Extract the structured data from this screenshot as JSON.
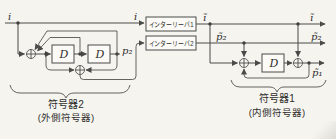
{
  "diagram": {
    "type": "block-diagram",
    "signals": {
      "input_left": "i",
      "input_before_interleaver1": "i",
      "i_interleaved_mid": "ĩ",
      "i_interleaved_out": "ĩ",
      "p2": "p₂",
      "p2_interleaved_mid": "p̃₂",
      "p2_interleaved_out": "p̃₂",
      "p1_out": "p̃₁"
    },
    "blocks": {
      "interleaver1": "インターリーバ1",
      "interleaver2": "インターリーバ2",
      "delay1": "D",
      "delay2": "D",
      "delay3": "D"
    },
    "groups": {
      "encoder2_title": "符号器2",
      "encoder2_subtitle": "(外側符号器)",
      "encoder1_title": "符号器1",
      "encoder1_subtitle": "(内側符号器)"
    },
    "colors": {
      "stroke": "#4a4a48",
      "background": "#f5f4ef",
      "box_fill": "#fbfaf6",
      "text": "#2e2d2b"
    }
  }
}
